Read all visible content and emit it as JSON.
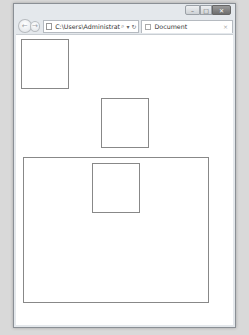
{
  "window": {
    "controls": {
      "minimize_label": "–",
      "maximize_label": "□",
      "close_label": "✕"
    }
  },
  "toolbar": {
    "back_icon": "←",
    "forward_icon": "→",
    "address": "C:\\Users\\Administrat",
    "search_icon": "⌕",
    "dropdown_icon": "▾",
    "refresh_icon": "↻"
  },
  "tab": {
    "label": "Document",
    "close_icon": "×"
  },
  "content": {
    "boxes": [
      {
        "name": "box-top-left",
        "left": 5,
        "top": 4,
        "width": 48,
        "height": 50
      },
      {
        "name": "box-middle",
        "left": 85,
        "top": 63,
        "width": 48,
        "height": 50
      },
      {
        "name": "container-box",
        "left": 7,
        "top": 122,
        "width": 186,
        "height": 146
      },
      {
        "name": "inner-box",
        "left": 76,
        "top": 128,
        "width": 48,
        "height": 50
      }
    ]
  }
}
